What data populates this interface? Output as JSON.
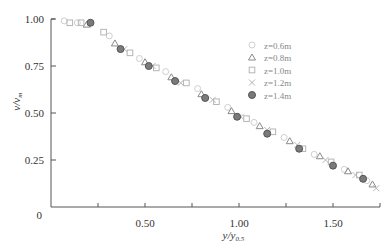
{
  "chart_data": {
    "type": "scatter",
    "title": "",
    "xlabel": "y/y0.5",
    "xlabel_main": "y/y",
    "xlabel_sub": "0.5",
    "ylabel_main": "v/v",
    "ylabel_sub": "m",
    "xlim": [
      0,
      1.75
    ],
    "ylim": [
      0,
      1.0
    ],
    "x_ticks": [
      0.25,
      0.5,
      0.75,
      1.0,
      1.25,
      1.5,
      1.75
    ],
    "x_tick_labels": [
      {
        "v": 0.5,
        "t": "0.50"
      },
      {
        "v": 1.0,
        "t": "1.00"
      },
      {
        "v": 1.5,
        "t": "1.50"
      }
    ],
    "y_ticks": [
      {
        "v": 0.25,
        "t": "0.25"
      },
      {
        "v": 0.5,
        "t": "0.50"
      },
      {
        "v": 0.75,
        "t": "0.75"
      },
      {
        "v": 1.0,
        "t": "1.00"
      }
    ],
    "origin_label": "0",
    "grid": false,
    "legend_position": "upper right",
    "series": [
      {
        "name": "z=0.6m",
        "marker": "circle-open",
        "points": [
          [
            0.07,
            0.99
          ],
          [
            0.14,
            0.98
          ],
          [
            0.31,
            0.91
          ],
          [
            0.47,
            0.79
          ],
          [
            0.61,
            0.72
          ],
          [
            0.78,
            0.63
          ],
          [
            0.94,
            0.53
          ],
          [
            1.08,
            0.45
          ],
          [
            1.24,
            0.37
          ],
          [
            1.4,
            0.28
          ],
          [
            1.56,
            0.2
          ],
          [
            1.68,
            0.14
          ]
        ]
      },
      {
        "name": "z=0.8m",
        "marker": "triangle-open",
        "points": [
          [
            0.19,
            0.97
          ],
          [
            0.34,
            0.87
          ],
          [
            0.5,
            0.77
          ],
          [
            0.64,
            0.69
          ],
          [
            0.8,
            0.6
          ],
          [
            0.96,
            0.51
          ],
          [
            1.11,
            0.43
          ],
          [
            1.27,
            0.35
          ],
          [
            1.43,
            0.27
          ],
          [
            1.58,
            0.19
          ],
          [
            1.71,
            0.12
          ]
        ]
      },
      {
        "name": "z=1.0m",
        "marker": "square-open",
        "points": [
          [
            0.1,
            0.98
          ],
          [
            0.16,
            0.98
          ],
          [
            0.28,
            0.93
          ],
          [
            0.42,
            0.82
          ],
          [
            0.56,
            0.74
          ],
          [
            0.72,
            0.66
          ],
          [
            0.88,
            0.56
          ],
          [
            1.04,
            0.47
          ],
          [
            1.18,
            0.4
          ],
          [
            1.34,
            0.31
          ],
          [
            1.49,
            0.24
          ],
          [
            1.64,
            0.17
          ]
        ]
      },
      {
        "name": "z=1.2m",
        "marker": "x",
        "points": [
          [
            0.39,
            0.84
          ],
          [
            0.54,
            0.75
          ],
          [
            0.69,
            0.66
          ],
          [
            0.86,
            0.57
          ],
          [
            1.01,
            0.48
          ],
          [
            1.15,
            0.41
          ],
          [
            1.31,
            0.33
          ],
          [
            1.46,
            0.25
          ],
          [
            1.62,
            0.17
          ],
          [
            1.73,
            0.1
          ]
        ]
      },
      {
        "name": "z=1.4m",
        "marker": "circle-filled",
        "points": [
          [
            0.21,
            0.98
          ],
          [
            0.37,
            0.84
          ],
          [
            0.52,
            0.75
          ],
          [
            0.66,
            0.67
          ],
          [
            0.82,
            0.58
          ],
          [
            0.99,
            0.48
          ],
          [
            1.15,
            0.39
          ],
          [
            1.32,
            0.31
          ],
          [
            1.5,
            0.22
          ],
          [
            1.66,
            0.15
          ]
        ]
      }
    ]
  }
}
